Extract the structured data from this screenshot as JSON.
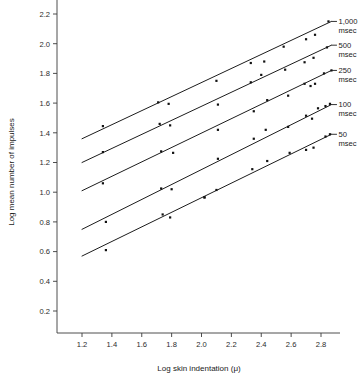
{
  "figure": {
    "background": "#ffffff",
    "ink_color": "#1a1a1a"
  },
  "chart_data": {
    "type": "scatter",
    "title": "",
    "subtitle": "",
    "xlabel": "Log skin indentation (μ)",
    "ylabel": "Log mean number of impulses",
    "xlim": [
      1.1,
      2.95
    ],
    "ylim": [
      0.1,
      2.28
    ],
    "xticks": [
      1.2,
      1.4,
      1.6,
      1.8,
      2.0,
      2.2,
      2.4,
      2.6,
      2.8
    ],
    "xtick_labels": [
      "1.2",
      "1.4",
      "1.6",
      "1.8",
      "2.0",
      "2.2",
      "2.4",
      "2.6",
      "2.8"
    ],
    "yticks": [
      0.2,
      0.4,
      0.6,
      0.8,
      1.0,
      1.2,
      1.4,
      1.6,
      1.8,
      2.0,
      2.2
    ],
    "ytick_labels": [
      "0.2",
      "0.4",
      "0.6",
      "0.8",
      "1.0",
      "1.2",
      "1.4",
      "1.6",
      "1.8",
      "2.0",
      "2.2"
    ],
    "grid": false,
    "legend_position": "right-inline-annotations",
    "series": [
      {
        "name": "1,000 msec",
        "label_line1": "1,000",
        "label_line2": "msec",
        "fit_line": {
          "x": [
            1.2,
            2.87
          ],
          "y": [
            1.36,
            2.15
          ]
        },
        "points": [
          {
            "x": 1.34,
            "y": 1.445
          },
          {
            "x": 1.71,
            "y": 1.605
          },
          {
            "x": 1.78,
            "y": 1.595
          },
          {
            "x": 2.1,
            "y": 1.75
          },
          {
            "x": 2.33,
            "y": 1.87
          },
          {
            "x": 2.42,
            "y": 1.88
          },
          {
            "x": 2.55,
            "y": 1.98
          },
          {
            "x": 2.7,
            "y": 2.03
          },
          {
            "x": 2.76,
            "y": 2.06
          },
          {
            "x": 2.85,
            "y": 2.15
          }
        ]
      },
      {
        "name": "500 msec",
        "label_line1": "500",
        "label_line2": "msec",
        "fit_line": {
          "x": [
            1.2,
            2.87
          ],
          "y": [
            1.2,
            1.99
          ]
        },
        "points": [
          {
            "x": 1.34,
            "y": 1.27
          },
          {
            "x": 1.72,
            "y": 1.46
          },
          {
            "x": 1.73,
            "y": 1.275
          },
          {
            "x": 1.79,
            "y": 1.45
          },
          {
            "x": 1.81,
            "y": 1.265
          },
          {
            "x": 2.11,
            "y": 1.59
          },
          {
            "x": 2.33,
            "y": 1.74
          },
          {
            "x": 2.4,
            "y": 1.79
          },
          {
            "x": 2.56,
            "y": 1.825
          },
          {
            "x": 2.69,
            "y": 1.875
          },
          {
            "x": 2.75,
            "y": 1.905
          },
          {
            "x": 2.84,
            "y": 1.975
          }
        ]
      },
      {
        "name": "250 msec",
        "label_line1": "250",
        "label_line2": "msec",
        "fit_line": {
          "x": [
            1.2,
            2.87
          ],
          "y": [
            1.01,
            1.82
          ]
        },
        "points": [
          {
            "x": 1.34,
            "y": 1.06
          },
          {
            "x": 1.73,
            "y": 1.025
          },
          {
            "x": 1.8,
            "y": 1.02
          },
          {
            "x": 2.11,
            "y": 1.42
          },
          {
            "x": 2.35,
            "y": 1.545
          },
          {
            "x": 2.44,
            "y": 1.62
          },
          {
            "x": 2.58,
            "y": 1.65
          },
          {
            "x": 2.69,
            "y": 1.73
          },
          {
            "x": 2.73,
            "y": 1.715
          },
          {
            "x": 2.76,
            "y": 1.73
          },
          {
            "x": 2.82,
            "y": 1.8
          },
          {
            "x": 2.87,
            "y": 1.82
          }
        ]
      },
      {
        "name": "100 msec",
        "label_line1": "100",
        "label_line2": "msec",
        "fit_line": {
          "x": [
            1.2,
            2.87
          ],
          "y": [
            0.75,
            1.59
          ]
        },
        "points": [
          {
            "x": 1.36,
            "y": 0.8
          },
          {
            "x": 1.74,
            "y": 0.85
          },
          {
            "x": 2.02,
            "y": 0.965
          },
          {
            "x": 2.11,
            "y": 1.225
          },
          {
            "x": 2.35,
            "y": 1.36
          },
          {
            "x": 2.43,
            "y": 1.42
          },
          {
            "x": 2.58,
            "y": 1.44
          },
          {
            "x": 2.7,
            "y": 1.515
          },
          {
            "x": 2.74,
            "y": 1.495
          },
          {
            "x": 2.78,
            "y": 1.565
          },
          {
            "x": 2.83,
            "y": 1.58
          },
          {
            "x": 2.86,
            "y": 1.595
          }
        ]
      },
      {
        "name": "50 msec",
        "label_line1": "50",
        "label_line2": "msec",
        "fit_line": {
          "x": [
            1.2,
            2.87
          ],
          "y": [
            0.57,
            1.39
          ]
        },
        "points": [
          {
            "x": 1.36,
            "y": 0.61
          },
          {
            "x": 1.79,
            "y": 0.83
          },
          {
            "x": 2.02,
            "y": 0.965
          },
          {
            "x": 2.1,
            "y": 1.015
          },
          {
            "x": 2.34,
            "y": 1.155
          },
          {
            "x": 2.44,
            "y": 1.21
          },
          {
            "x": 2.59,
            "y": 1.265
          },
          {
            "x": 2.7,
            "y": 1.285
          },
          {
            "x": 2.75,
            "y": 1.3
          },
          {
            "x": 2.83,
            "y": 1.375
          },
          {
            "x": 2.86,
            "y": 1.39
          }
        ]
      }
    ]
  }
}
